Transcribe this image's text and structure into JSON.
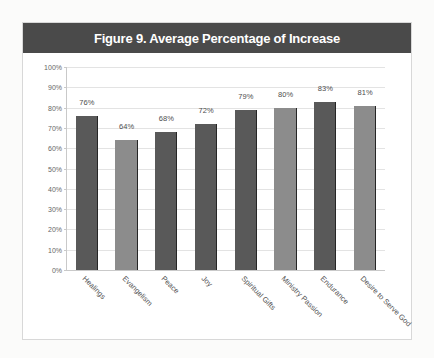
{
  "figure": {
    "title": "Figure 9. Average Percentage of Increase"
  },
  "colors": {
    "title_bar": "#4a4a4a",
    "title_text": "#ffffff",
    "bar_dark": "#595959",
    "bar_light": "#8c8c8c",
    "bar_edge": "#262626",
    "gridline": "#e3e3e3",
    "card_border": "#d8d8d8",
    "page_background": "#fbfbfa"
  },
  "chart_data": {
    "type": "bar",
    "title": "Figure 9. Average Percentage of Increase",
    "xlabel": "",
    "ylabel": "",
    "ylim": [
      0,
      100
    ],
    "ytick_labels": [
      "100%",
      "90%",
      "80%",
      "70%",
      "60%",
      "50%",
      "40%",
      "30%",
      "20%",
      "10%",
      "0%"
    ],
    "ytick_values": [
      100,
      90,
      80,
      70,
      60,
      50,
      40,
      30,
      20,
      10,
      0
    ],
    "grid": true,
    "legend": "none",
    "categories": [
      "Healings",
      "Evangelism",
      "Peace",
      "Joy",
      "Spiritual Gifts",
      "Ministry Passion",
      "Endurance",
      "Desire to Serve God"
    ],
    "values": [
      76,
      64,
      68,
      72,
      79,
      80,
      83,
      81
    ],
    "data_labels": [
      "76%",
      "64%",
      "68%",
      "72%",
      "79%",
      "80%",
      "83%",
      "81%"
    ],
    "bar_shades": [
      "dark",
      "light",
      "dark",
      "dark",
      "dark",
      "light",
      "dark",
      "light"
    ]
  }
}
